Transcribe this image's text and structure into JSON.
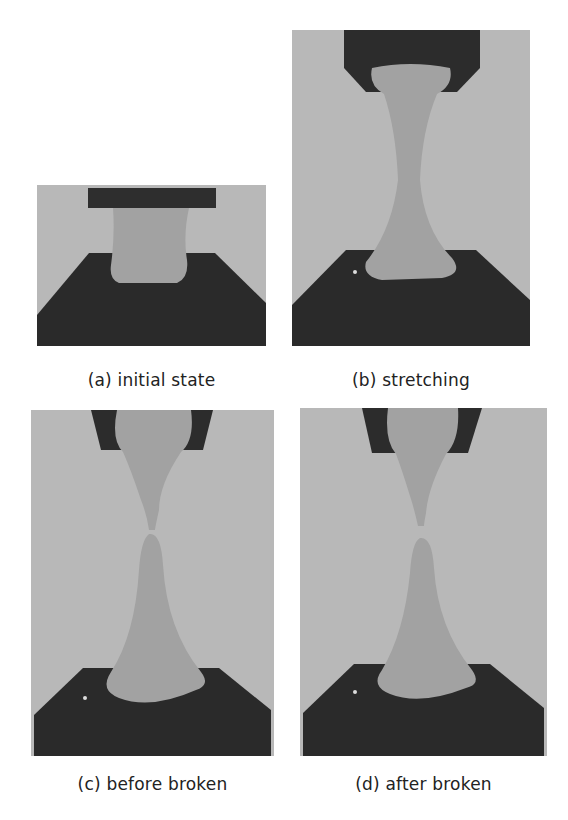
{
  "figure": {
    "panels": [
      {
        "id": "a",
        "caption": "(a) initial state"
      },
      {
        "id": "b",
        "caption": "(b) stretching"
      },
      {
        "id": "c",
        "caption": "(c) before broken"
      },
      {
        "id": "d",
        "caption": "(d) after broken"
      }
    ],
    "colors": {
      "background": "#b6b6b6",
      "plate": "#2a2a2a",
      "specimen": "#a0a0a0"
    }
  }
}
